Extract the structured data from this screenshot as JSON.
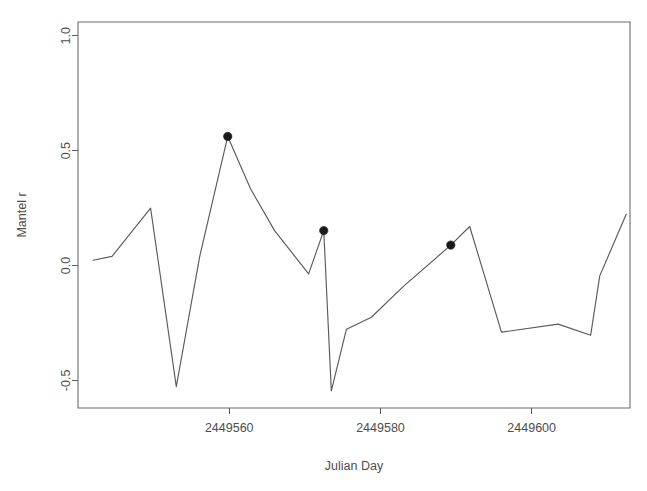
{
  "chart_data": {
    "type": "line",
    "title": "",
    "xlabel": "Julian Day",
    "ylabel": "Mantel r",
    "xlim": [
      2449540.0,
      2449613.0
    ],
    "ylim": [
      -0.62,
      1.06
    ],
    "xticks": [
      2449560,
      2449580,
      2449600
    ],
    "xtick_labels": [
      "2449560",
      "2449580",
      "2449600"
    ],
    "yticks": [
      -0.5,
      0.0,
      0.5,
      1.0
    ],
    "ytick_labels": [
      "-0.5",
      "0.0",
      "0.5",
      "1.0"
    ],
    "grid": false,
    "legend": null,
    "series": [
      {
        "name": "Mantel r",
        "x": [
          2449542.0,
          2449544.5,
          2449549.6,
          2449553.0,
          2449556.1,
          2449559.8,
          2449562.8,
          2449566.0,
          2449570.5,
          2449572.5,
          2449573.5,
          2449575.5,
          2449578.8,
          2449583.0,
          2449589.3,
          2449591.8,
          2449596.0,
          2449603.5,
          2449607.8,
          2449609.0,
          2449612.5
        ],
        "y": [
          0.023,
          0.04,
          0.25,
          -0.527,
          0.04,
          0.562,
          0.335,
          0.152,
          -0.036,
          0.152,
          -0.545,
          -0.277,
          -0.225,
          -0.092,
          0.089,
          0.17,
          -0.29,
          -0.255,
          -0.303,
          -0.045,
          0.223
        ],
        "highlighted_points": [
          {
            "x": 2449559.8,
            "y": 0.562
          },
          {
            "x": 2449572.5,
            "y": 0.152
          },
          {
            "x": 2449589.3,
            "y": 0.089
          }
        ],
        "marker": "filled-circle",
        "line_color": "#5a5a5a",
        "point_color": "#1a1a1a"
      }
    ]
  },
  "axes": {
    "x_axis_label": "Julian Day",
    "y_axis_label": "Mantel r"
  }
}
